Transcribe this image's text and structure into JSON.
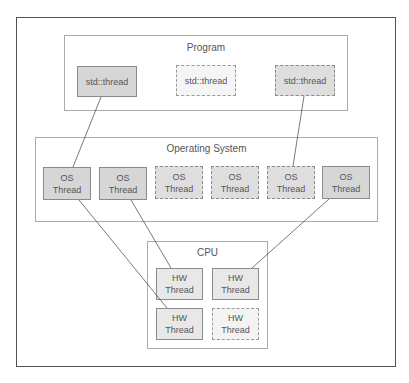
{
  "diagram": {
    "groups": {
      "program": {
        "title": "Program"
      },
      "os": {
        "title": "Operating System"
      },
      "cpu": {
        "title": "CPU"
      }
    },
    "program_threads": [
      {
        "label": "std::thread",
        "style": "solid"
      },
      {
        "label": "std::thread",
        "style": "dotted-light"
      },
      {
        "label": "std::thread",
        "style": "dotted"
      }
    ],
    "os_threads": [
      {
        "line1": "OS",
        "line2": "Thread",
        "style": "solid"
      },
      {
        "line1": "OS",
        "line2": "Thread",
        "style": "solid"
      },
      {
        "line1": "OS",
        "line2": "Thread",
        "style": "dotted"
      },
      {
        "line1": "OS",
        "line2": "Thread",
        "style": "dotted"
      },
      {
        "line1": "OS",
        "line2": "Thread",
        "style": "dotted"
      },
      {
        "line1": "OS",
        "line2": "Thread",
        "style": "solid"
      }
    ],
    "hw_threads": [
      {
        "line1": "HW",
        "line2": "Thread",
        "style": "solid"
      },
      {
        "line1": "HW",
        "line2": "Thread",
        "style": "solid"
      },
      {
        "line1": "HW",
        "line2": "Thread",
        "style": "solid"
      },
      {
        "line1": "HW",
        "line2": "Thread",
        "style": "dotted"
      }
    ],
    "connections": [
      {
        "from": "program_threads.0",
        "to": "os_threads.0"
      },
      {
        "from": "program_threads.2",
        "to": "os_threads.4"
      },
      {
        "from": "os_threads.0",
        "to": "hw_threads.2"
      },
      {
        "from": "os_threads.1",
        "to": "hw_threads.0"
      },
      {
        "from": "os_threads.5",
        "to": "hw_threads.1"
      }
    ],
    "colors": {
      "frame_border": "#555555",
      "group_border": "#aaaaaa",
      "node_fill_dark": "#d6d6d6",
      "node_fill_light": "#f5f5f5",
      "hw_fill": "#e8e8e8",
      "line": "#555555"
    }
  }
}
